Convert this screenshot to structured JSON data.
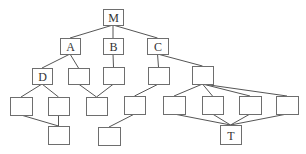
{
  "diagram": {
    "type": "directed acyclic graph",
    "nodes": [
      {
        "id": "M",
        "label": "M"
      },
      {
        "id": "A",
        "label": "A"
      },
      {
        "id": "B",
        "label": "B"
      },
      {
        "id": "C",
        "label": "C"
      },
      {
        "id": "D",
        "label": "D"
      },
      {
        "id": "a2",
        "label": ""
      },
      {
        "id": "b1",
        "label": ""
      },
      {
        "id": "c1",
        "label": ""
      },
      {
        "id": "c2",
        "label": ""
      },
      {
        "id": "d1",
        "label": ""
      },
      {
        "id": "d2",
        "label": ""
      },
      {
        "id": "ab",
        "label": ""
      },
      {
        "id": "c1a",
        "label": ""
      },
      {
        "id": "c2a",
        "label": ""
      },
      {
        "id": "c2b",
        "label": ""
      },
      {
        "id": "c2c",
        "label": ""
      },
      {
        "id": "c2d",
        "label": ""
      },
      {
        "id": "dd",
        "label": ""
      },
      {
        "id": "c1b",
        "label": ""
      },
      {
        "id": "T",
        "label": "T"
      }
    ],
    "edges": [
      [
        "M",
        "A"
      ],
      [
        "M",
        "B"
      ],
      [
        "M",
        "C"
      ],
      [
        "A",
        "D"
      ],
      [
        "A",
        "a2"
      ],
      [
        "B",
        "b1"
      ],
      [
        "C",
        "c1"
      ],
      [
        "C",
        "c2"
      ],
      [
        "D",
        "d1"
      ],
      [
        "D",
        "d2"
      ],
      [
        "a2",
        "ab"
      ],
      [
        "b1",
        "ab"
      ],
      [
        "c1",
        "c1a"
      ],
      [
        "c2",
        "c2a"
      ],
      [
        "c2",
        "c2b"
      ],
      [
        "c2",
        "c2c"
      ],
      [
        "c2",
        "c2d"
      ],
      [
        "d1",
        "dd"
      ],
      [
        "d2",
        "dd"
      ],
      [
        "c1a",
        "c1b"
      ],
      [
        "c2a",
        "T"
      ],
      [
        "c2b",
        "T"
      ],
      [
        "c2c",
        "T"
      ],
      [
        "c2d",
        "T"
      ]
    ]
  }
}
